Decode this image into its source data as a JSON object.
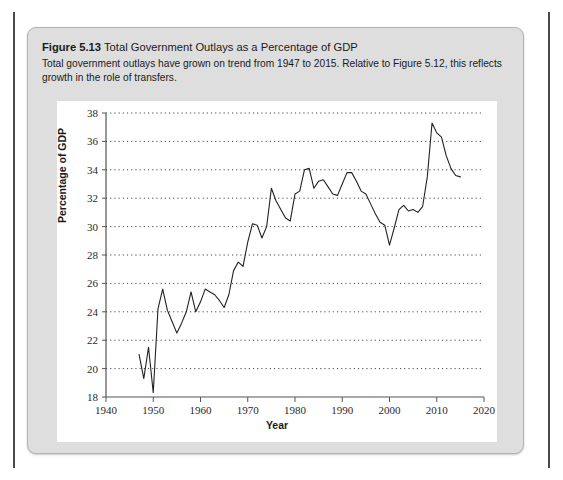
{
  "figure": {
    "number_label": "Figure 5.13",
    "title": "Total Government Outlays as a Percentage of GDP",
    "description": "Total government outlays have grown on trend from 1947 to 2015. Relative to Figure 5.12, this reflects growth in the role of transfers."
  },
  "chart_data": {
    "type": "line",
    "title": "Total Government Outlays as a Percentage of GDP",
    "xlabel": "Year",
    "ylabel": "Percentage of GDP",
    "xlim": [
      1940,
      2020
    ],
    "ylim": [
      18,
      38
    ],
    "xticks": [
      1940,
      1950,
      1960,
      1970,
      1980,
      1990,
      2000,
      2010,
      2020
    ],
    "yticks": [
      18,
      20,
      22,
      24,
      26,
      28,
      30,
      32,
      34,
      36,
      38
    ],
    "grid": "horizontal-dotted",
    "legend": "none",
    "line_color": "#222222",
    "series": [
      {
        "name": "Total government outlays",
        "x": [
          1947,
          1948,
          1949,
          1950,
          1951,
          1952,
          1953,
          1954,
          1955,
          1956,
          1957,
          1958,
          1959,
          1960,
          1961,
          1962,
          1963,
          1964,
          1965,
          1966,
          1967,
          1968,
          1969,
          1970,
          1971,
          1972,
          1973,
          1974,
          1975,
          1976,
          1977,
          1978,
          1979,
          1980,
          1981,
          1982,
          1983,
          1984,
          1985,
          1986,
          1987,
          1988,
          1989,
          1990,
          1991,
          1992,
          1993,
          1994,
          1995,
          1996,
          1997,
          1998,
          1999,
          2000,
          2001,
          2002,
          2003,
          2004,
          2005,
          2006,
          2007,
          2008,
          2009,
          2010,
          2011,
          2012,
          2013,
          2014,
          2015
        ],
        "values": [
          21.0,
          19.3,
          21.5,
          18.3,
          24.2,
          25.6,
          24.1,
          23.3,
          22.5,
          23.2,
          24.0,
          25.4,
          24.0,
          24.7,
          25.6,
          25.4,
          25.2,
          24.8,
          24.3,
          25.2,
          26.9,
          27.5,
          27.2,
          28.9,
          30.2,
          30.1,
          29.2,
          30.0,
          32.7,
          31.8,
          31.2,
          30.6,
          30.4,
          32.3,
          32.5,
          34.0,
          34.1,
          32.7,
          33.2,
          33.3,
          32.8,
          32.3,
          32.2,
          33.0,
          33.8,
          33.8,
          33.2,
          32.5,
          32.3,
          31.6,
          30.9,
          30.3,
          30.1,
          28.7,
          29.9,
          31.2,
          31.5,
          31.1,
          31.2,
          31.0,
          31.4,
          33.5,
          37.3,
          36.6,
          36.3,
          35.0,
          34.1,
          33.6,
          33.5
        ]
      }
    ]
  }
}
